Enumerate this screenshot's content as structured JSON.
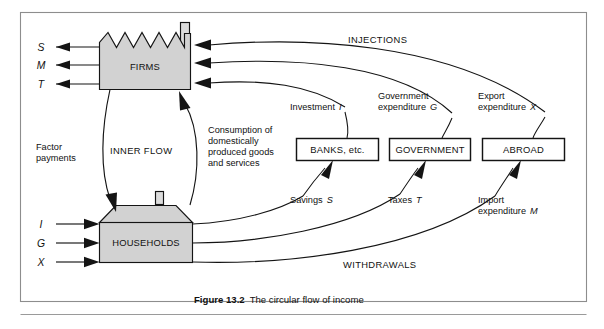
{
  "figure": {
    "caption_bold": "Figure 13.2",
    "caption_text": "The circular flow of income"
  },
  "sectors": {
    "firms": "FIRMS",
    "households": "HOUSEHOLDS",
    "banks": "BANKS, etc.",
    "government": "GOVERNMENT",
    "abroad": "ABROAD"
  },
  "flow_labels": {
    "injections": "INJECTIONS",
    "withdrawals": "WITHDRAWALS",
    "inner_flow": "INNER FLOW",
    "factor_payments_line1": "Factor",
    "factor_payments_line2": "payments",
    "consumption_line1": "Consumption of",
    "consumption_line2": "domestically",
    "consumption_line3": "produced goods",
    "consumption_line4": "and services"
  },
  "injections": [
    {
      "name": "investment",
      "line1": "Investment",
      "symbol": "I"
    },
    {
      "name": "government-expenditure",
      "line1": "Government",
      "line2": "expenditure",
      "symbol": "G"
    },
    {
      "name": "export-expenditure",
      "line1": "Export",
      "line2": "expenditure",
      "symbol": "X"
    }
  ],
  "withdrawals": [
    {
      "name": "savings",
      "line1": "Savings",
      "symbol": "S"
    },
    {
      "name": "taxes",
      "line1": "Taxes",
      "symbol": "T"
    },
    {
      "name": "import-expenditure",
      "line1": "Import",
      "line2": "expenditure",
      "symbol": "M"
    }
  ],
  "firms_outflow_symbols": [
    {
      "name": "savings-symbol",
      "symbol": "S"
    },
    {
      "name": "imports-symbol",
      "symbol": "M"
    },
    {
      "name": "taxes-symbol",
      "symbol": "T"
    }
  ],
  "households_inflow_symbols": [
    {
      "name": "investment-symbol",
      "symbol": "I"
    },
    {
      "name": "government-symbol",
      "symbol": "G"
    },
    {
      "name": "exports-symbol",
      "symbol": "X"
    }
  ]
}
